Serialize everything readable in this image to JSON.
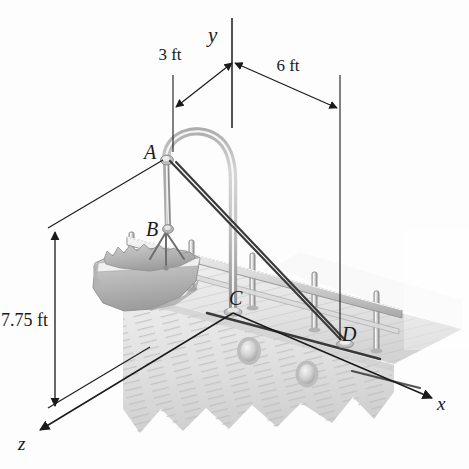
{
  "figure": {
    "background_color": "#fdfdfd",
    "line_color": "#1a1a1a"
  },
  "axes": {
    "y_label": "y",
    "x_label": "x",
    "z_label": "z"
  },
  "dimensions": [
    {
      "id": "dim-3ft",
      "label": "3 ft",
      "value": 3,
      "unit": "ft",
      "orientation": "horizontal"
    },
    {
      "id": "dim-6ft",
      "label": "6 ft",
      "value": 6,
      "unit": "ft",
      "orientation": "horizontal"
    },
    {
      "id": "dim-775ft",
      "label": "7.75 ft",
      "value": 7.75,
      "unit": "ft",
      "orientation": "vertical"
    }
  ],
  "points": [
    {
      "id": "point-a",
      "label": "A",
      "role": "davit-arm-tip"
    },
    {
      "id": "point-b",
      "label": "B",
      "role": "boat-sling-attachment"
    },
    {
      "id": "point-c",
      "label": "C",
      "role": "davit-base-on-deck"
    },
    {
      "id": "point-d",
      "label": "D",
      "role": "cable-anchor-on-deck"
    }
  ],
  "objects": [
    {
      "id": "davit",
      "name": "davit-arm"
    },
    {
      "id": "lifeboat",
      "name": "lifeboat"
    },
    {
      "id": "railing",
      "name": "deck-railing"
    },
    {
      "id": "hull",
      "name": "ship-hull"
    },
    {
      "id": "portholes",
      "name": "portholes",
      "count": 2
    },
    {
      "id": "cables",
      "name": "support-cables",
      "count": 2
    }
  ],
  "colors": {
    "ink": "#1a1a1a",
    "metal_light": "#f2f2f2",
    "metal_mid": "#cfcfcf",
    "metal_dark": "#9a9a9a",
    "hull_light": "#ececec",
    "hull_mid": "#d8d8d8",
    "boat_mid": "#c4c4c4",
    "boat_dark": "#a5a5a5"
  }
}
